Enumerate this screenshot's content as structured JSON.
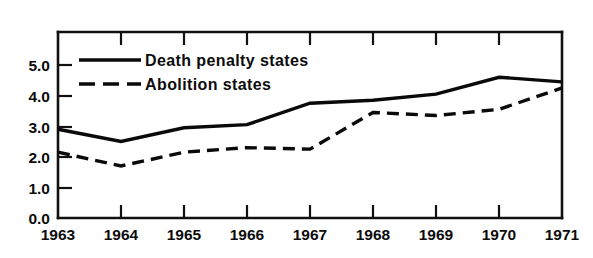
{
  "chart_data": {
    "type": "line",
    "title": "",
    "subtitle": "",
    "xlabel": "",
    "ylabel": "",
    "categories": [
      "1963",
      "1964",
      "1965",
      "1966",
      "1967",
      "1968",
      "1969",
      "1970",
      "1971"
    ],
    "x": [
      1963,
      1964,
      1965,
      1966,
      1967,
      1968,
      1969,
      1970,
      1971
    ],
    "xlim": [
      1963,
      1971
    ],
    "ylim": [
      0.0,
      5.8
    ],
    "ytick_labels": [
      "0.0",
      "1.0",
      "2.0",
      "3.0",
      "4.0",
      "5.0"
    ],
    "ytick_values": [
      0.0,
      1.0,
      2.0,
      3.0,
      4.0,
      5.0
    ],
    "xtick_labels": [
      "1963",
      "1964",
      "1965",
      "1966",
      "1967",
      "1968",
      "1969",
      "1970",
      "1971"
    ],
    "grid": false,
    "legend_position": "top-left inside plot",
    "series": [
      {
        "name": "Death penalty states",
        "style": "solid",
        "color": "#0a0a0a",
        "values": [
          2.9,
          2.5,
          2.95,
          3.05,
          3.75,
          3.85,
          4.05,
          4.6,
          4.45
        ]
      },
      {
        "name": "Abolition states",
        "style": "dashed",
        "color": "#0a0a0a",
        "values": [
          2.15,
          1.7,
          2.15,
          2.3,
          2.25,
          3.45,
          3.35,
          3.55,
          4.25
        ]
      }
    ],
    "annotations": []
  },
  "legend": {
    "items": [
      {
        "label": "Death penalty states",
        "style": "solid"
      },
      {
        "label": "Abolition states",
        "style": "dashed"
      }
    ]
  },
  "axes": {
    "y": {
      "labels": [
        "5.0",
        "4.0",
        "3.0",
        "2.0",
        "1.0",
        "0.0"
      ]
    },
    "x": {
      "labels": [
        "1963",
        "1964",
        "1965",
        "1966",
        "1967",
        "1968",
        "1969",
        "1970",
        "1971"
      ]
    }
  }
}
